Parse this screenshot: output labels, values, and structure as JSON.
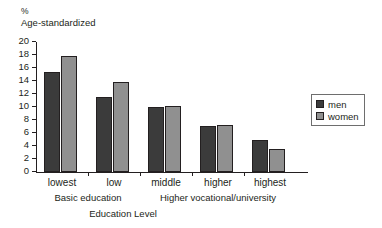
{
  "chart_data": {
    "type": "bar",
    "title": "",
    "subtitle": "",
    "ylabel_line1": "%",
    "ylabel_line2": "Age-standardized",
    "xlabel": "Education Level",
    "categories": [
      "lowest",
      "low",
      "middle",
      "higher",
      "highest"
    ],
    "series": [
      {
        "name": "men",
        "color": "#3b3b3b",
        "values": [
          15.4,
          11.5,
          10.0,
          7.1,
          4.9
        ]
      },
      {
        "name": "women",
        "color": "#909090",
        "values": [
          17.9,
          13.8,
          10.2,
          7.2,
          3.6
        ]
      }
    ],
    "ylim": [
      0,
      20
    ],
    "ytick_step": 2,
    "yticks": [
      0,
      2,
      4,
      6,
      8,
      10,
      12,
      14,
      16,
      18,
      20
    ],
    "ytick_labels": [
      "0",
      "2",
      "4",
      "6",
      "8",
      "10",
      "12",
      "14",
      "16",
      "18",
      "20"
    ],
    "grid": false,
    "legend_position": "right",
    "legend_entries": [
      "men",
      "women"
    ],
    "category_groups": [
      {
        "label": "Basic education",
        "categories": [
          "lowest",
          "low"
        ]
      },
      {
        "label": "Higher vocational/university",
        "categories": [
          "middle",
          "higher",
          "highest"
        ]
      }
    ]
  }
}
